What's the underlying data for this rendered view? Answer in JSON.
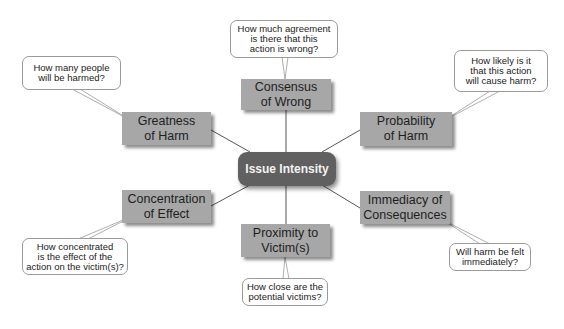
{
  "center": {
    "label": "Issue Intensity",
    "color": "#606060"
  },
  "nodes": [
    {
      "id": "consensus",
      "label": "Consensus\nof Wrong",
      "question": "How much agreement\nis there that this\naction is wrong?"
    },
    {
      "id": "greatness",
      "label": "Greatness\nof Harm",
      "question": "How many people\nwill be harmed?"
    },
    {
      "id": "probability",
      "label": "Probability\nof Harm",
      "question": "How likely is it\nthat this action\nwill cause harm?"
    },
    {
      "id": "concentration",
      "label": "Concentration\nof Effect",
      "question": "How concentrated\nis the effect of the\naction on the victim(s)?"
    },
    {
      "id": "proximity",
      "label": "Proximity to\nVictim(s)",
      "question": "How close are the\npotential victims?"
    },
    {
      "id": "immediacy",
      "label": "Immediacy of\nConsequences",
      "question": "Will harm be felt\nimmediately?"
    }
  ],
  "colors": {
    "node": "#a7a7a7",
    "bubble_border": "#9a9a9a",
    "line": "#444444"
  }
}
